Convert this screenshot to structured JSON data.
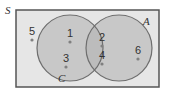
{
  "diagram": {
    "type": "venn",
    "universe": {
      "label": "S",
      "x": 16,
      "y": 10,
      "w": 143,
      "h": 77,
      "fill": "#e6e6e6",
      "stroke": "#555555"
    },
    "sets": [
      {
        "label": "C",
        "cx": 70,
        "cy": 48,
        "r": 33,
        "fill": "#c8c8c8",
        "stroke": "#6e6e6e",
        "label_x": 58,
        "label_y": 82
      },
      {
        "label": "A",
        "cx": 119,
        "cy": 48,
        "r": 33,
        "fill": "#c8c8c8",
        "stroke": "#6e6e6e",
        "label_x": 143,
        "label_y": 25
      }
    ],
    "intersection_fill": "#bcbcbc",
    "points": [
      {
        "label": "5",
        "x": 32,
        "y": 38,
        "region": "S only"
      },
      {
        "label": "1",
        "x": 70,
        "y": 40,
        "region": "C only"
      },
      {
        "label": "3",
        "x": 66,
        "y": 65,
        "region": "C only"
      },
      {
        "label": "2",
        "x": 102,
        "y": 44,
        "region": "C and A"
      },
      {
        "label": "4",
        "x": 102,
        "y": 62,
        "region": "C and A"
      },
      {
        "label": "6",
        "x": 138,
        "y": 57,
        "region": "A only"
      }
    ],
    "point_color": "#808080"
  }
}
